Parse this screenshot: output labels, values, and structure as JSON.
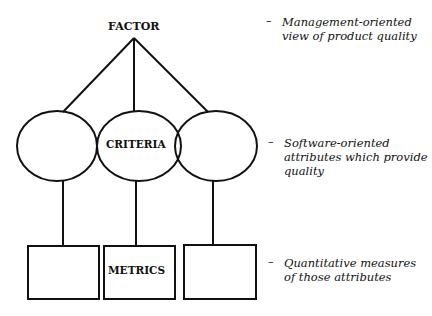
{
  "diagram": {
    "levels": [
      {
        "name": "factor",
        "label": "FACTOR",
        "description": "Management-oriented view of product quality"
      },
      {
        "name": "criteria",
        "label": "CRITERIA",
        "description": "Software-oriented attributes which provide quality"
      },
      {
        "name": "metrics",
        "label": "METRICS",
        "description": "Quantitative measures of those attributes"
      }
    ],
    "dash": "–"
  },
  "notes": {
    "factor_line1": "Management-oriented",
    "factor_line2": "view of product quality",
    "criteria_line1": "Software-oriented",
    "criteria_line2": "attributes which provide",
    "criteria_line3": "quality",
    "metrics_line1": "Quantitative measures",
    "metrics_line2": "of those attributes"
  }
}
